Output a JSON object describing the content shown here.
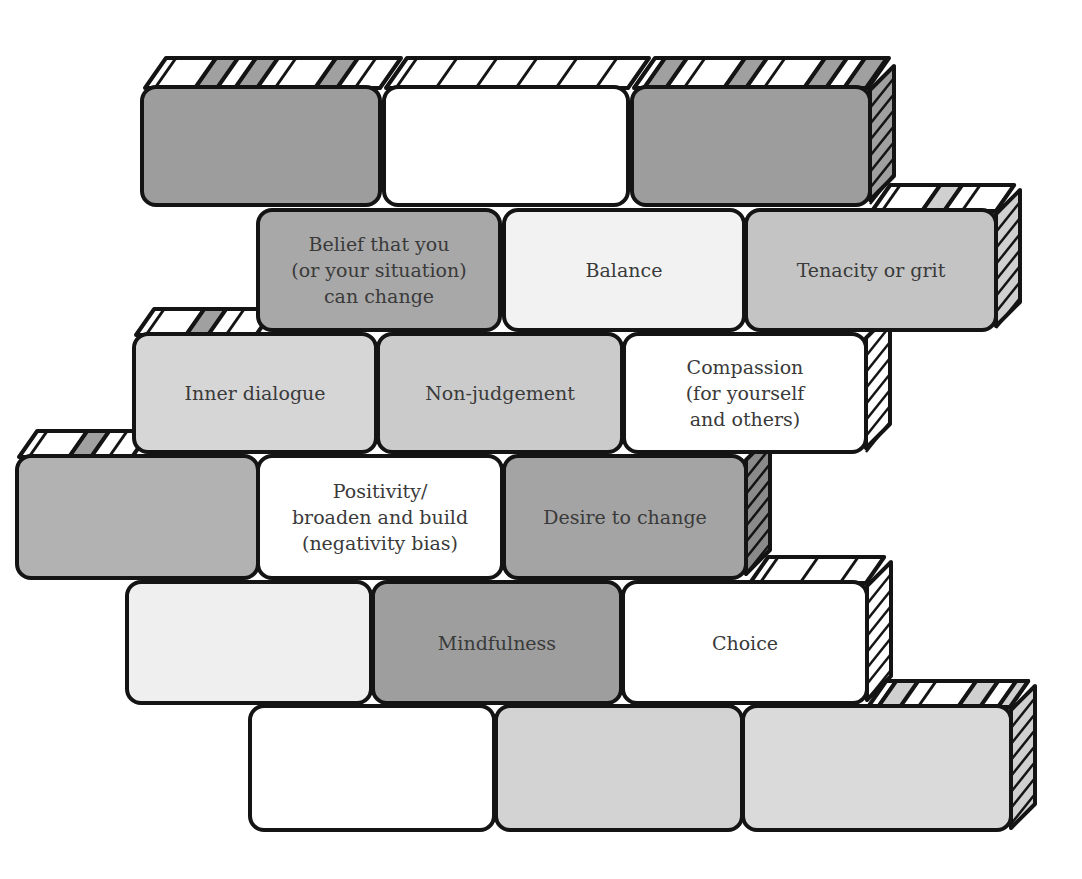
{
  "diagram": {
    "type": "brick-wall",
    "colors": {
      "outline": "#141414",
      "dark": "#9a9a9a",
      "medium": "#b0b0b0",
      "light": "#d2d2d2",
      "very_light": "#e9e9e9",
      "white": "#ffffff",
      "text": "#3a3a3a"
    },
    "rows": [
      {
        "bricks": [
          {
            "label": "",
            "fill": "#9d9d9d",
            "x": 140,
            "y": 85,
            "w": 242,
            "h": 122
          },
          {
            "label": "",
            "fill": "#ffffff",
            "x": 382,
            "y": 85,
            "w": 248,
            "h": 122
          },
          {
            "label": "",
            "fill": "#9d9d9d",
            "x": 630,
            "y": 85,
            "w": 242,
            "h": 122
          }
        ]
      },
      {
        "bricks": [
          {
            "label": "Belief that you\n(or your situation)\ncan change",
            "fill": "#a8a8a8",
            "x": 256,
            "y": 208,
            "w": 246,
            "h": 124
          },
          {
            "label": "Balance",
            "fill": "#f2f2f2",
            "x": 502,
            "y": 208,
            "w": 244,
            "h": 124
          },
          {
            "label": "Tenacity or grit",
            "fill": "#c4c4c4",
            "x": 744,
            "y": 208,
            "w": 254,
            "h": 124
          }
        ]
      },
      {
        "bricks": [
          {
            "label": "Inner dialogue",
            "fill": "#d6d6d6",
            "x": 132,
            "y": 332,
            "w": 246,
            "h": 122
          },
          {
            "label": "Non-judgement",
            "fill": "#cbcbcb",
            "x": 376,
            "y": 332,
            "w": 248,
            "h": 122
          },
          {
            "label": "Compassion\n(for yourself\nand others)",
            "fill": "#ffffff",
            "x": 622,
            "y": 332,
            "w": 246,
            "h": 122
          }
        ]
      },
      {
        "bricks": [
          {
            "label": "",
            "fill": "#b2b2b2",
            "x": 15,
            "y": 454,
            "w": 245,
            "h": 126
          },
          {
            "label": "Positivity/\nbroaden and build\n(negativity bias)",
            "fill": "#ffffff",
            "x": 256,
            "y": 454,
            "w": 248,
            "h": 126
          },
          {
            "label": "Desire to change",
            "fill": "#a4a4a4",
            "x": 502,
            "y": 454,
            "w": 246,
            "h": 126
          }
        ]
      },
      {
        "bricks": [
          {
            "label": "",
            "fill": "#efefef",
            "x": 125,
            "y": 580,
            "w": 248,
            "h": 125
          },
          {
            "label": "Mindfulness",
            "fill": "#9e9e9e",
            "x": 371,
            "y": 580,
            "w": 252,
            "h": 125
          },
          {
            "label": "Choice",
            "fill": "#ffffff",
            "x": 621,
            "y": 580,
            "w": 248,
            "h": 125
          }
        ]
      },
      {
        "bricks": [
          {
            "label": "",
            "fill": "#ffffff",
            "x": 248,
            "y": 704,
            "w": 248,
            "h": 128
          },
          {
            "label": "",
            "fill": "#d3d3d3",
            "x": 494,
            "y": 704,
            "w": 250,
            "h": 128
          },
          {
            "label": "",
            "fill": "#dadada",
            "x": 741,
            "y": 704,
            "w": 272,
            "h": 128
          }
        ]
      }
    ],
    "labels": [
      "Belief that you (or your situation) can change",
      "Balance",
      "Tenacity or grit",
      "Inner dialogue",
      "Non-judgement",
      "Compassion (for yourself and others)",
      "Positivity/ broaden and build (negativity bias)",
      "Desire to change",
      "Mindfulness",
      "Choice"
    ]
  }
}
